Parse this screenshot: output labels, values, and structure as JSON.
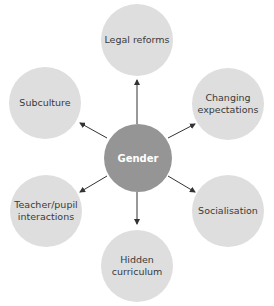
{
  "diagram": {
    "type": "spider",
    "center": {
      "label": "Gender",
      "color": "#959595"
    },
    "nodes": [
      {
        "id": "legal-reforms",
        "label": "Legal reforms"
      },
      {
        "id": "changing-expectations",
        "label": "Changing\nexpectations"
      },
      {
        "id": "socialisation",
        "label": "Socialisation"
      },
      {
        "id": "hidden-curriculum",
        "label": "Hidden\ncurriculum"
      },
      {
        "id": "teacher-pupil-interactions",
        "label": "Teacher/pupil\ninteractions"
      },
      {
        "id": "subculture",
        "label": "Subculture"
      }
    ],
    "node_color": "#dedede",
    "arrow_color": "#333333"
  }
}
